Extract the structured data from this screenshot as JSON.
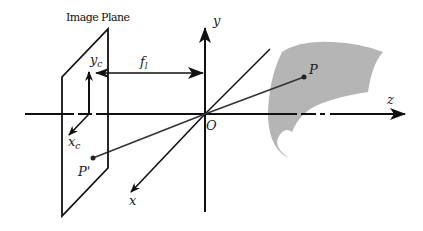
{
  "diagram": {
    "title": "Image Plane",
    "labels": {
      "y_axis": "y",
      "z_axis": "z",
      "x_axis": "x",
      "origin": "O",
      "focal_length": "f",
      "focal_length_sub": "l",
      "image_y": "y",
      "image_y_sub": "c",
      "image_x": "x",
      "image_x_sub": "c",
      "point": "P",
      "projected_point": "P'"
    },
    "colors": {
      "line": "#111111",
      "object": "#b5b5b5",
      "background": "#ffffff"
    }
  }
}
